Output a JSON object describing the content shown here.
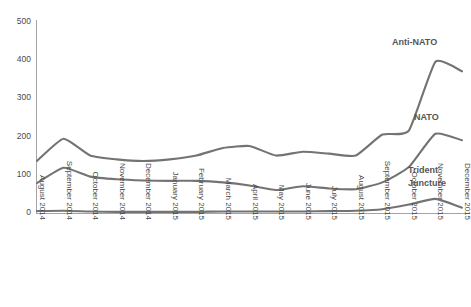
{
  "chart_data": {
    "type": "line",
    "title": "",
    "subtitle": "",
    "xlabel": "",
    "ylabel": "",
    "grid": false,
    "legend_position": "inline-right",
    "ylim": [
      0,
      500
    ],
    "yticks": [
      0,
      100,
      200,
      300,
      400,
      500
    ],
    "ytick_labels": [
      "0",
      "100",
      "200",
      "300",
      "400",
      "500"
    ],
    "categories": [
      "August 2014",
      "September 2014",
      "October 2014",
      "November 2014",
      "December 2014",
      "January 2015",
      "February 2015",
      "March 2015",
      "April 2015",
      "May 2015",
      "June 2015",
      "July 2015",
      "August 2015",
      "September 2015",
      "October 2015",
      "November 2015",
      "December 2015"
    ],
    "series": [
      {
        "name": "Anti-NATO",
        "color": "#737373",
        "values": [
          136,
          194,
          150,
          140,
          136,
          140,
          150,
          170,
          175,
          150,
          160,
          155,
          150,
          205,
          215,
          395,
          370
        ]
      },
      {
        "name": "NATO",
        "color": "#737373",
        "values": [
          78,
          118,
          95,
          88,
          85,
          84,
          84,
          80,
          72,
          60,
          70,
          64,
          62,
          80,
          120,
          207,
          190
        ]
      },
      {
        "name": "Trident Juncture",
        "color": "#737373",
        "values": [
          5,
          6,
          4,
          3,
          3,
          3,
          3,
          4,
          4,
          4,
          4,
          5,
          6,
          10,
          22,
          37,
          14
        ]
      }
    ],
    "annotations": [
      {
        "text": "Anti-NATO",
        "x_px": 392,
        "y_px": 45
      },
      {
        "text": "NATO",
        "x_px": 414,
        "y_px": 120
      },
      {
        "text": "Trident",
        "x_px": 408,
        "y_px": 173
      },
      {
        "text": "Juncture",
        "x_px": 408,
        "y_px": 186
      }
    ]
  }
}
